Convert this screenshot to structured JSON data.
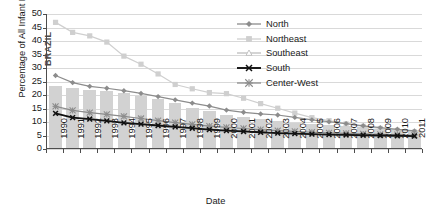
{
  "chart_data": {
    "type": "line",
    "title": "",
    "xlabel": "Date",
    "ylabel": "Percentage of All Infant Deaths",
    "ylim": [
      0,
      50
    ],
    "ytick_step": 5,
    "yticks": [
      "50",
      "45",
      "40",
      "35",
      "30",
      "25",
      "20",
      "15",
      "10",
      "5",
      "0"
    ],
    "grid": true,
    "legend_position": "top-right",
    "annotation": "BRAZIL",
    "categories": [
      "1990",
      "1991",
      "1992",
      "1993",
      "1994",
      "1995",
      "1996",
      "1997",
      "1998",
      "1999",
      "2000",
      "2001",
      "2002",
      "2003",
      "2004",
      "2005",
      "2006",
      "2007",
      "2008",
      "2009",
      "2010",
      "2011"
    ],
    "bars": {
      "name": "BRAZIL",
      "color": "#d2d2d2",
      "values": [
        23.0,
        22.3,
        21.6,
        21.0,
        20.3,
        19.2,
        18.0,
        16.6,
        15.0,
        13.6,
        12.4,
        11.5,
        10.7,
        10.0,
        9.4,
        8.9,
        8.4,
        8.0,
        7.6,
        7.2,
        6.9,
        6.6
      ]
    },
    "series": [
      {
        "name": "North",
        "color": "#8c8c8c",
        "marker": "diamond",
        "values": [
          27.2,
          24.6,
          23.2,
          22.5,
          21.6,
          20.6,
          19.4,
          18.2,
          17.0,
          15.9,
          14.4,
          13.6,
          13.0,
          12.6,
          11.7,
          10.8,
          10.1,
          9.4,
          8.6,
          7.9,
          7.3,
          6.7
        ]
      },
      {
        "name": "Northeast",
        "color": "#cfcfcf",
        "marker": "square",
        "values": [
          46.9,
          43.2,
          41.9,
          39.6,
          34.4,
          31.4,
          27.8,
          23.9,
          22.3,
          20.9,
          20.5,
          18.8,
          16.8,
          15.1,
          13.3,
          11.6,
          10.5,
          9.3,
          8.4,
          7.6,
          6.9,
          6.3
        ]
      },
      {
        "name": "Southeast",
        "color": "#bdbdbd",
        "marker": "open-triangle",
        "values": [
          13.2,
          11.6,
          11.1,
          10.4,
          9.7,
          9.1,
          8.5,
          8.0,
          7.5,
          7.0,
          6.7,
          6.4,
          6.1,
          5.8,
          5.6,
          5.4,
          5.2,
          5.1,
          5.0,
          4.9,
          4.8,
          4.7
        ]
      },
      {
        "name": "South",
        "color": "#111111",
        "marker": "x",
        "values": [
          13.2,
          11.6,
          11.1,
          10.4,
          9.7,
          9.2,
          8.7,
          8.2,
          7.7,
          7.2,
          6.8,
          6.5,
          6.2,
          5.9,
          5.7,
          5.5,
          5.3,
          5.2,
          5.1,
          5.0,
          4.9,
          4.8
        ]
      },
      {
        "name": "Center-West",
        "color": "#8c8c8c",
        "marker": "asterisk",
        "values": [
          15.8,
          14.3,
          13.5,
          12.8,
          12.1,
          11.3,
          10.5,
          9.8,
          9.1,
          8.5,
          8.0,
          7.6,
          7.2,
          6.8,
          6.5,
          6.2,
          6.0,
          5.8,
          5.6,
          5.4,
          5.3,
          5.1
        ]
      }
    ]
  }
}
